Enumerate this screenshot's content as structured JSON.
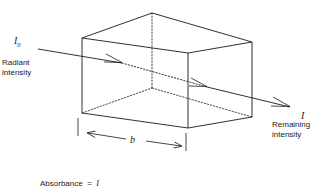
{
  "figure": {
    "type": "beer-lambert-absorption-cell",
    "background_color": "#ffffff",
    "line_color": "#1a1a1a"
  },
  "labels": {
    "incident_symbol": "I",
    "incident_subscript": "0",
    "incident_caption_line1": "Radiant",
    "incident_caption_line2": "intensity",
    "exit_symbol": "I",
    "exit_caption_line1": "Remaining",
    "exit_caption_line2": "intensity",
    "path_length_symbol": "b"
  },
  "equation": {
    "lhs": "Absorbance",
    "equals": "=",
    "numerator": "I",
    "numerator_subscript": "0",
    "denominator": "I"
  },
  "geometry": {
    "front_top_left": [
      82,
      38
    ],
    "front_top_right": [
      188,
      53
    ],
    "front_bottom_left": [
      82,
      113
    ],
    "front_bottom_right": [
      188,
      128
    ],
    "back_top_left": [
      152,
      13
    ],
    "back_top_right": [
      252,
      42
    ],
    "back_bottom_left": [
      152,
      88
    ],
    "back_bottom_right": [
      252,
      117
    ],
    "ray_start": [
      38,
      49
    ],
    "ray_end": [
      292,
      108
    ],
    "arrow_1": [
      120,
      62
    ],
    "arrow_2": [
      205,
      86
    ],
    "arrow_exit": [
      288,
      106
    ]
  }
}
